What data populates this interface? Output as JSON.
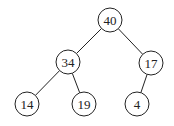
{
  "diagram": {
    "type": "binary-tree",
    "colors": {
      "stroke": "#222222",
      "fill": "#ffffff",
      "text": "#222222"
    },
    "node_radius": 12,
    "nodes": [
      {
        "id": "n40",
        "label": "40",
        "x": 110,
        "y": 20
      },
      {
        "id": "n34",
        "label": "34",
        "x": 68,
        "y": 62
      },
      {
        "id": "n17",
        "label": "17",
        "x": 151,
        "y": 63
      },
      {
        "id": "n14",
        "label": "14",
        "x": 27,
        "y": 104
      },
      {
        "id": "n19",
        "label": "19",
        "x": 84,
        "y": 104
      },
      {
        "id": "n4",
        "label": "4",
        "x": 137,
        "y": 104
      }
    ],
    "edges": [
      {
        "from": "n40",
        "to": "n34"
      },
      {
        "from": "n40",
        "to": "n17"
      },
      {
        "from": "n34",
        "to": "n14"
      },
      {
        "from": "n34",
        "to": "n19"
      },
      {
        "from": "n17",
        "to": "n4"
      }
    ]
  }
}
